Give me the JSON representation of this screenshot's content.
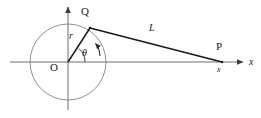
{
  "figure": {
    "type": "geometry-diagram",
    "background_color": "#ffffff",
    "stroke_color": "#1a1a1a",
    "circle_color": "#8c8c8c",
    "axis_color": "#7a7a7a"
  },
  "labels": {
    "origin": "O",
    "point_q": "Q",
    "point_p": "P",
    "radius": "r",
    "angle": "θ",
    "segment_l": "L",
    "axis_x": "x",
    "coordinate_x": "x"
  },
  "geometry": {
    "circle": {
      "cx": 68,
      "cy": 62,
      "r": 38
    },
    "origin_point": {
      "x": 68,
      "y": 62
    },
    "point_q": {
      "x": 90,
      "y": 28
    },
    "point_p": {
      "x": 222,
      "y": 62
    },
    "x_axis": {
      "x1": 10,
      "y1": 62,
      "x2": 245,
      "y2": 62
    },
    "y_axis": {
      "x1": 68,
      "y1": 110,
      "x2": 68,
      "y2": 5
    },
    "angle_arc_radius": 17,
    "rotation_arrow": "counterclockwise"
  }
}
